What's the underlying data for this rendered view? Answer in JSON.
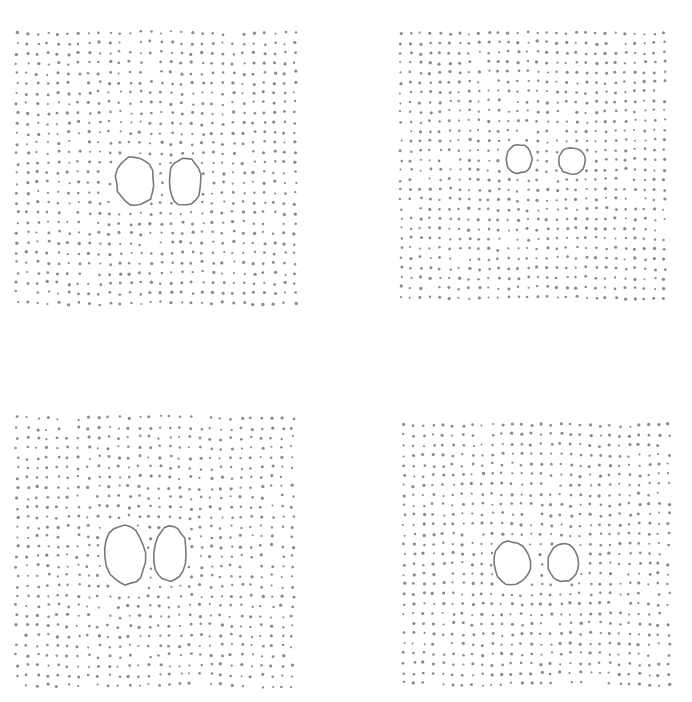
{
  "figure": {
    "background": "#ffffff",
    "dot_color": "#8a8a8a",
    "outline_color": "#7a7a7a",
    "panels": [
      {
        "id": "top-left",
        "grid": {
          "x0": 17,
          "y0": 33,
          "cols": 28,
          "rows": 28,
          "dx": 10.3,
          "dy": 10.0,
          "jitter": 1.4,
          "dot_r": 1.35
        },
        "holes": [
          {
            "cx": 135,
            "cy": 181,
            "rx": 19,
            "ry": 26,
            "tilt": -8
          },
          {
            "cx": 185,
            "cy": 182,
            "rx": 16,
            "ry": 25,
            "tilt": 0
          }
        ]
      },
      {
        "id": "top-right",
        "grid": {
          "x0": 401,
          "y0": 33,
          "cols": 28,
          "rows": 28,
          "dx": 9.75,
          "dy": 9.8,
          "jitter": 1.1,
          "dot_r": 1.35
        },
        "holes": [
          {
            "cx": 519,
            "cy": 159,
            "rx": 13,
            "ry": 15,
            "tilt": 0
          },
          {
            "cx": 572,
            "cy": 161,
            "rx": 13,
            "ry": 14,
            "tilt": 0
          }
        ]
      },
      {
        "id": "bottom-left",
        "grid": {
          "x0": 17,
          "y0": 418,
          "cols": 28,
          "rows": 28,
          "dx": 10.2,
          "dy": 9.9,
          "jitter": 1.6,
          "dot_r": 1.35
        },
        "holes": [
          {
            "cx": 125,
            "cy": 555,
            "rx": 20,
            "ry": 31,
            "tilt": -6
          },
          {
            "cx": 170,
            "cy": 554,
            "rx": 16,
            "ry": 29,
            "tilt": 3
          }
        ]
      },
      {
        "id": "bottom-right",
        "grid": {
          "x0": 404,
          "y0": 425,
          "cols": 28,
          "rows": 27,
          "dx": 9.8,
          "dy": 9.95,
          "jitter": 1.3,
          "dot_r": 1.35
        },
        "holes": [
          {
            "cx": 512,
            "cy": 563,
            "rx": 18,
            "ry": 23,
            "tilt": -4
          },
          {
            "cx": 563,
            "cy": 563,
            "rx": 15,
            "ry": 20,
            "tilt": 0
          }
        ]
      }
    ]
  }
}
